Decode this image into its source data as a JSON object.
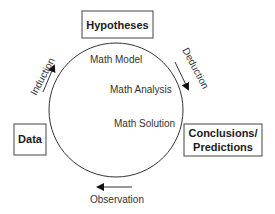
{
  "diagram": {
    "boxes": {
      "hypotheses": "Hypotheses",
      "data": "Data",
      "conclusions_line1": "Conclusions/",
      "conclusions_line2": "Predictions"
    },
    "inner_labels": {
      "model": "Math Model",
      "analysis": "Math Analysis",
      "solution": "Math Solution"
    },
    "arrows": {
      "induction": "Induction",
      "deduction": "Deduction",
      "observation": "Observation"
    },
    "colors": {
      "stroke": "#333333",
      "text": "#1a1a1a",
      "background": "#ffffff"
    }
  }
}
